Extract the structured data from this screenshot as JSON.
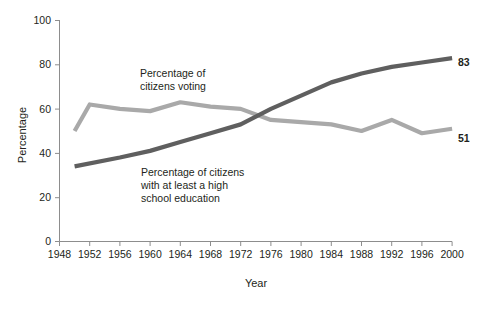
{
  "chart_data": {
    "type": "line",
    "title": "",
    "xlabel": "Year",
    "ylabel": "Percentage",
    "xlim": [
      1948,
      2000
    ],
    "ylim": [
      0,
      100
    ],
    "grid": false,
    "legend_position": "inline-annotations",
    "x_ticks": [
      1948,
      1952,
      1956,
      1960,
      1964,
      1968,
      1972,
      1976,
      1980,
      1984,
      1988,
      1992,
      1996,
      2000
    ],
    "y_ticks": [
      0,
      20,
      40,
      60,
      80,
      100
    ],
    "series": [
      {
        "name": "Percentage of citizens voting",
        "color": "#a9a9a9",
        "annotation": "Percentage of\ncitizens voting",
        "annotation_line1": "Percentage of",
        "annotation_line2": "citizens voting",
        "end_label": "51",
        "x": [
          1950,
          1952,
          1956,
          1960,
          1964,
          1968,
          1972,
          1976,
          1980,
          1984,
          1988,
          1992,
          1996,
          2000
        ],
        "values": [
          50,
          62,
          60,
          59,
          63,
          61,
          60,
          55,
          54,
          53,
          50,
          55,
          49,
          51
        ]
      },
      {
        "name": "Percentage of citizens with at least a high school education",
        "color": "#5f5f5f",
        "annotation": "Percentage of citizens\nwith at least a high\nschool education",
        "annotation_line1": "Percentage of citizens",
        "annotation_line2": "with at least a high",
        "annotation_line3": "school education",
        "end_label": "83",
        "x": [
          1950,
          1956,
          1960,
          1964,
          1968,
          1972,
          1976,
          1980,
          1984,
          1988,
          1992,
          1996,
          2000
        ],
        "values": [
          34,
          38,
          41,
          45,
          49,
          53,
          60,
          66,
          72,
          76,
          79,
          81,
          83
        ]
      }
    ]
  },
  "axis": {
    "y_title": "Percentage",
    "x_title": "Year",
    "y_tick_labels": [
      "0",
      "20",
      "40",
      "60",
      "80",
      "100"
    ],
    "x_tick_labels": [
      "1948",
      "1952",
      "1956",
      "1960",
      "1964",
      "1968",
      "1972",
      "1976",
      "1980",
      "1984",
      "1988",
      "1992",
      "1996",
      "2000"
    ]
  },
  "annotations": {
    "voting_line1": "Percentage of",
    "voting_line2": "citizens voting",
    "education_line1": "Percentage of citizens",
    "education_line2": "with at least a high",
    "education_line3": "school education",
    "end_label_education": "83",
    "end_label_voting": "51"
  },
  "colors": {
    "voting": "#a9a9a9",
    "education": "#5f5f5f",
    "axis": "#8d8d8d",
    "text": "#231f20",
    "background": "#ffffff"
  }
}
